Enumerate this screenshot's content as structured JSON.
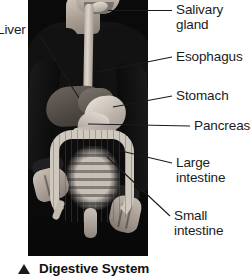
{
  "figure": {
    "caption": {
      "marker_icon": "triangle-up-icon",
      "text": "Digestive System"
    },
    "photo": {
      "alt_description": "Person in dark sweater with digestive system organs overlaid on torso"
    },
    "labels": [
      {
        "id": "liver",
        "text": "Liver",
        "side": "left"
      },
      {
        "id": "salivary-gland",
        "text": "Salivary\ngland",
        "side": "right"
      },
      {
        "id": "esophagus",
        "text": "Esophagus",
        "side": "right"
      },
      {
        "id": "stomach",
        "text": "Stomach",
        "side": "right"
      },
      {
        "id": "pancreas",
        "text": "Pancreas",
        "side": "right"
      },
      {
        "id": "large-intestine",
        "text": "Large\nintestine",
        "side": "right"
      },
      {
        "id": "small-intestine",
        "text": "Small\nintestine",
        "side": "right"
      }
    ],
    "colors": {
      "background": "#ffffff",
      "text": "#1b1b1b",
      "leader_line": "#1b1b1b",
      "photo_dark": "#0c0c0c",
      "organ_light": "#cfc8bf",
      "organ_dark": "#4e4843"
    }
  }
}
